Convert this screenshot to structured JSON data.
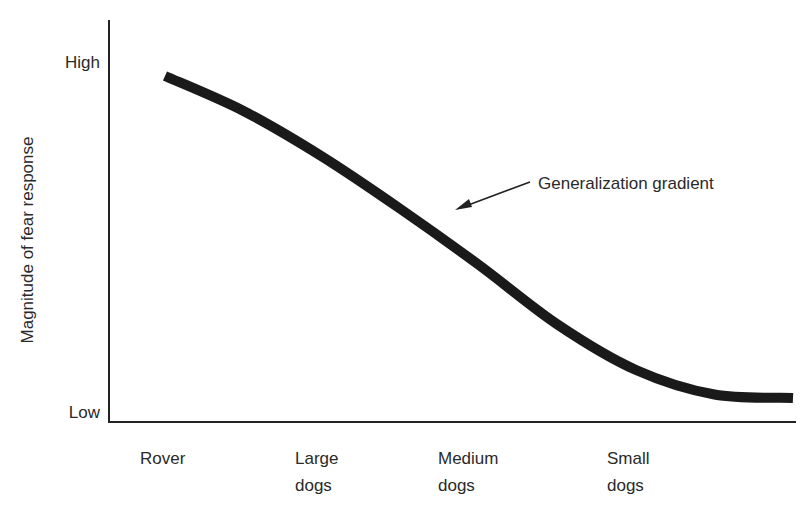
{
  "chart_data": {
    "type": "line",
    "title": "",
    "xlabel": "",
    "ylabel": "Magnitude of fear response",
    "y_ticks": [
      "Low",
      "High"
    ],
    "ylim": [
      0,
      1
    ],
    "grid": false,
    "categories": [
      {
        "line1": "Rover",
        "line2": ""
      },
      {
        "line1": "Large",
        "line2": "dogs"
      },
      {
        "line1": "Medium",
        "line2": "dogs"
      },
      {
        "line1": "Small",
        "line2": "dogs"
      }
    ],
    "series": [
      {
        "name": "Generalization gradient",
        "x": [
          0,
          0.5,
          1,
          1.5,
          2,
          2.5,
          3,
          3.5,
          4
        ],
        "values": [
          0.96,
          0.86,
          0.73,
          0.58,
          0.42,
          0.25,
          0.12,
          0.05,
          0.04
        ]
      }
    ],
    "annotations": [
      {
        "text": "Generalization gradient",
        "target_x": 2.0,
        "target_y": 0.58
      }
    ]
  }
}
